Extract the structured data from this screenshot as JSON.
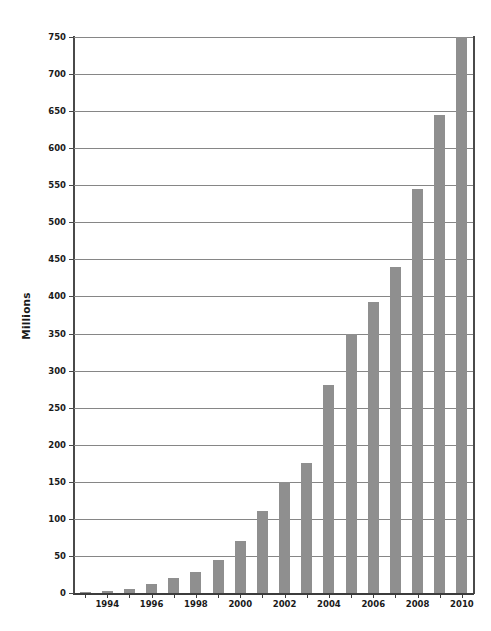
{
  "chart_data": {
    "type": "bar",
    "title": "",
    "subtitle": "",
    "xlabel": "",
    "ylabel": "Millions",
    "categories": [
      "1993",
      "1994",
      "1995",
      "1996",
      "1997",
      "1998",
      "1999",
      "2000",
      "2001",
      "2002",
      "2003",
      "2004",
      "2005",
      "2006",
      "2007",
      "2008",
      "2009",
      "2010"
    ],
    "values": [
      2,
      3,
      6,
      12,
      20,
      29,
      45,
      70,
      111,
      150,
      175,
      280,
      350,
      392,
      440,
      545,
      645,
      750
    ],
    "series": [
      {
        "name": "Millions",
        "values": [
          2,
          3,
          6,
          12,
          20,
          29,
          45,
          70,
          111,
          150,
          175,
          280,
          350,
          392,
          440,
          545,
          645,
          750
        ]
      }
    ],
    "ylim": [
      0,
      750
    ],
    "ytick_step": 50,
    "yticks": [
      0,
      50,
      100,
      150,
      200,
      250,
      300,
      350,
      400,
      450,
      500,
      550,
      600,
      650,
      700,
      750
    ],
    "ytick_labels": [
      "0",
      "50",
      "100",
      "150",
      "200",
      "250",
      "300",
      "350",
      "400",
      "450",
      "500",
      "550",
      "600",
      "650",
      "700",
      "750"
    ],
    "xtick_labels": [
      "1994",
      "1996",
      "1998",
      "2000",
      "2002",
      "2004",
      "2006",
      "2008",
      "2010"
    ],
    "xtick_labeled_categories": [
      "1994",
      "1996",
      "1998",
      "2000",
      "2002",
      "2004",
      "2006",
      "2008",
      "2010"
    ],
    "grid": true,
    "grid_axis": "y",
    "legend": false,
    "legend_position": "none",
    "bar_color": "#8f8f8f",
    "grid_color": "#868686",
    "axis_color": "#3c3c3c",
    "text_color": "#1a1a1a",
    "background_color": "#ffffff",
    "annotations": []
  }
}
